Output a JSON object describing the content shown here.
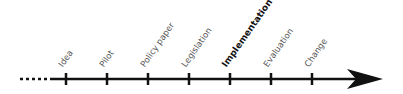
{
  "timeline": {
    "line_color": "#111111",
    "lead_in": "dotted",
    "stages": [
      {
        "label": "Idea",
        "x": 66,
        "emphasis": false
      },
      {
        "label": "Pilot",
        "x": 107,
        "emphasis": false
      },
      {
        "label": "Policy paper",
        "x": 148,
        "emphasis": false
      },
      {
        "label": "Legislation",
        "x": 189,
        "emphasis": false
      },
      {
        "label": "Implementation",
        "x": 230,
        "emphasis": true
      },
      {
        "label": "Evaluation",
        "x": 271,
        "emphasis": false
      },
      {
        "label": "Change",
        "x": 312,
        "emphasis": false
      }
    ]
  }
}
